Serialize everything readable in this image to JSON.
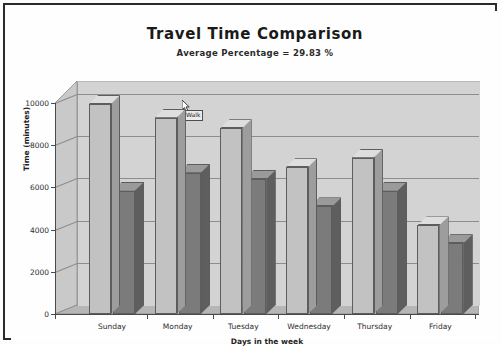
{
  "window": {
    "frame_color": "#2a2a2a",
    "background": "#fefefe"
  },
  "chart_data": {
    "type": "bar",
    "title": "Travel Time Comparison",
    "subtitle": "Average Percentage = 29.83 %",
    "xlabel": "Days in the week",
    "ylabel": "Time (minutes)",
    "ylim": [
      0,
      10000
    ],
    "yticks": [
      0,
      2000,
      4000,
      6000,
      8000,
      10000
    ],
    "ytick_labels": [
      "0",
      "2000",
      "4000",
      "6000",
      "8000",
      "10000"
    ],
    "categories": [
      "Sunday",
      "Monday",
      "Tuesday",
      "Wednesday",
      "Thursday",
      "Friday"
    ],
    "grid": true,
    "legend": "none",
    "three_d": true,
    "series": [
      {
        "name": "Series 1",
        "color": "#c2c2c2",
        "side_color": "#9d9d9d",
        "top_color": "#dedede",
        "values": [
          9950,
          9300,
          8800,
          6950,
          7400,
          4200
        ]
      },
      {
        "name": "Series 2",
        "color": "#7b7b7b",
        "side_color": "#5e5e5e",
        "top_color": "#9a9a9a",
        "values": [
          5850,
          6700,
          6400,
          5100,
          5850,
          3350
        ]
      }
    ],
    "plot_background": "#d3d3d3",
    "gridline_color": "#8d8d8d",
    "axis_color": "#4a4a4a"
  },
  "overlay": {
    "tooltip_text": "Walk",
    "cursor": "arrow-pointer"
  }
}
